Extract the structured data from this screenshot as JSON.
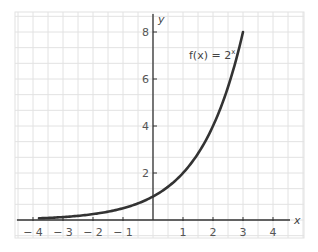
{
  "chart_data": {
    "type": "line",
    "title": "",
    "xlabel": "x",
    "ylabel": "y",
    "xlim": [
      -4.6,
      5.0
    ],
    "ylim": [
      -0.75,
      8.8
    ],
    "grid": true,
    "x_ticks": [
      -4,
      -3,
      -2,
      -1,
      1,
      2,
      3,
      4
    ],
    "x_tick_labels": [
      "− 4",
      "− 3",
      "− 2",
      "− 1",
      "1",
      "2",
      "3",
      "4"
    ],
    "y_ticks": [
      2,
      4,
      6,
      8
    ],
    "y_tick_labels": [
      "2",
      "4",
      "6",
      "8"
    ],
    "series": [
      {
        "name": "f(x) = 2^x",
        "function": "2^x",
        "x_range": [
          -3.8,
          3.0
        ],
        "x": [
          -3.8,
          -3,
          -2,
          -1,
          0,
          1,
          2,
          3
        ],
        "values": [
          0.07,
          0.125,
          0.25,
          0.5,
          1,
          2,
          4,
          8
        ],
        "color": "#333333"
      }
    ],
    "annotations": [
      {
        "text_prefix": "f(x) = 2",
        "superscript": "x",
        "x": 1.1,
        "y": 7.1
      }
    ]
  },
  "labels": {
    "x_axis": "x",
    "y_axis": "y",
    "function_prefix": "f(x) = 2",
    "function_exponent": "x"
  },
  "colors": {
    "grid": "#e2e2e2",
    "axis": "#333333",
    "curve": "#333333",
    "text": "#555555"
  }
}
